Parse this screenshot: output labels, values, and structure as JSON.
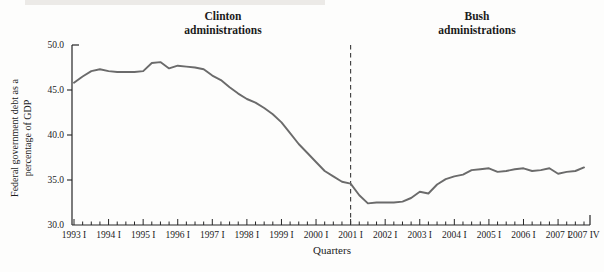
{
  "figure": {
    "clinton_annotation": {
      "line1": "Clinton",
      "line2": "administrations"
    },
    "bush_annotation": {
      "line1": "Bush",
      "line2": "administrations"
    },
    "x_axis_title": "Quarters",
    "y_axis_title_line1": "Federal government debt as a",
    "y_axis_title_line2": "percentage of GDP"
  },
  "chart_data": {
    "type": "line",
    "title": "",
    "xlabel": "Quarters",
    "ylabel": "Federal government debt as a percentage of GDP",
    "ylim": [
      30.0,
      50.0
    ],
    "ytick_values": [
      30,
      35,
      40,
      45,
      50
    ],
    "ytick_labels": [
      "30.0",
      "35.0",
      "40.0",
      "45.0",
      "50.0"
    ],
    "x_cadence": "quarterly",
    "x_start": "1993 I",
    "x_end": "2007 IV",
    "x_major_tick_labels": [
      "1993 I",
      "1994 I",
      "1995 I",
      "1996 I",
      "1997 I",
      "1998 I",
      "1999 I",
      "2000 I",
      "2001 I",
      "2002 I",
      "2003 I",
      "2004 I",
      "2005 I",
      "2006 I",
      "2007 I",
      "2007 IV"
    ],
    "divider": {
      "at_quarter_index": 32,
      "at_label": "2001 I",
      "style": "dashed"
    },
    "annotations": [
      "Clinton administrations",
      "Bush administrations"
    ],
    "grid": false,
    "legend": "none",
    "series": [
      {
        "name": "Federal government debt as a percentage of GDP",
        "values": [
          45.8,
          46.5,
          47.1,
          47.3,
          47.1,
          47.0,
          47.0,
          47.0,
          47.1,
          48.0,
          48.1,
          47.4,
          47.7,
          47.6,
          47.5,
          47.3,
          46.6,
          46.1,
          45.3,
          44.6,
          44.0,
          43.6,
          43.0,
          42.3,
          41.4,
          40.2,
          39.0,
          38.0,
          37.0,
          36.0,
          35.4,
          34.8,
          34.6,
          33.3,
          32.4,
          32.5,
          32.5,
          32.5,
          32.6,
          33.0,
          33.7,
          33.5,
          34.5,
          35.1,
          35.4,
          35.6,
          36.1,
          36.2,
          36.3,
          35.9,
          36.0,
          36.2,
          36.3,
          36.0,
          36.1,
          36.3,
          35.7,
          35.9,
          36.0,
          36.4
        ]
      }
    ],
    "colors": {
      "line": "#6b6b6b",
      "axis": "#262626",
      "divider": "#3c3c3c",
      "text": "#1c1c1c",
      "background": "#fdfdfc"
    }
  }
}
